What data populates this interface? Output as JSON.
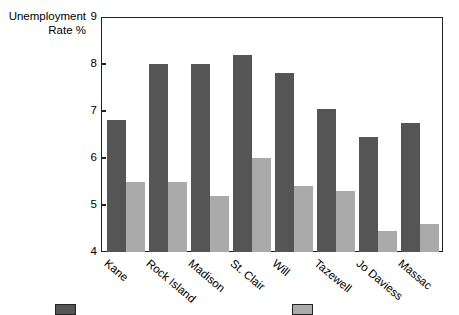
{
  "chart_data": {
    "type": "bar",
    "title": "",
    "xlabel": "",
    "ylabel": "Unemployment\nRate %",
    "ylim": [
      4,
      9
    ],
    "yticks": [
      4,
      5,
      6,
      7,
      8,
      9
    ],
    "ytick_labels": [
      "4",
      "5",
      "6",
      "7",
      "8",
      "9"
    ],
    "grid": false,
    "legend_position": "bottom",
    "categories": [
      "Kane",
      "Rock Island",
      "Madison",
      "St. Clair",
      "Will",
      "Tazewell",
      "Jo Daviess",
      "Massac"
    ],
    "series": [
      {
        "name": "",
        "color": "#555555",
        "values": [
          6.8,
          8.0,
          8.0,
          8.2,
          7.8,
          7.05,
          6.45,
          6.75
        ]
      },
      {
        "name": "",
        "color": "#aaaaaa",
        "values": [
          5.5,
          5.5,
          5.2,
          6.0,
          5.4,
          5.3,
          4.45,
          4.6
        ]
      }
    ]
  },
  "legend": {
    "items": [
      {
        "swatch_color": "#555555",
        "label": ""
      },
      {
        "swatch_color": "#aaaaaa",
        "label": ""
      }
    ]
  },
  "colors": {
    "series_dark": "#555555",
    "series_light": "#aaaaaa",
    "axis": "#222222",
    "background": "#ffffff"
  }
}
